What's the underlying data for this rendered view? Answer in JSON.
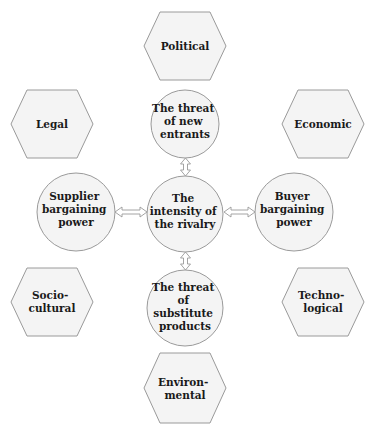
{
  "diagram": {
    "colors": {
      "shape_fill": "#f4f4f4",
      "shape_stroke": "#9a9a9a",
      "text": "#1a1a1a",
      "background": "#ffffff"
    },
    "pestel": [
      {
        "id": "political",
        "lines": [
          "Political"
        ]
      },
      {
        "id": "legal",
        "lines": [
          "Legal"
        ]
      },
      {
        "id": "economic",
        "lines": [
          "Economic"
        ]
      },
      {
        "id": "socio-cultural",
        "lines": [
          "Socio-",
          "cultural"
        ]
      },
      {
        "id": "technological",
        "lines": [
          "Techno-",
          "logical"
        ]
      },
      {
        "id": "environmental",
        "lines": [
          "Environ-",
          "mental"
        ]
      }
    ],
    "forces": [
      {
        "id": "new-entrants",
        "lines": [
          "The threat",
          "of new",
          "entrants"
        ]
      },
      {
        "id": "supplier",
        "lines": [
          "Supplier",
          "bargaining",
          "power"
        ]
      },
      {
        "id": "rivalry",
        "lines": [
          "The",
          "intensity of",
          "the rivalry"
        ]
      },
      {
        "id": "buyer",
        "lines": [
          "Buyer",
          "bargaining",
          "power"
        ]
      },
      {
        "id": "substitutes",
        "lines": [
          "The threat",
          "of",
          "substitute",
          "products"
        ]
      }
    ],
    "connectors": [
      {
        "from": "new-entrants",
        "to": "rivalry",
        "type": "double-arrow"
      },
      {
        "from": "supplier",
        "to": "rivalry",
        "type": "double-arrow"
      },
      {
        "from": "buyer",
        "to": "rivalry",
        "type": "double-arrow"
      },
      {
        "from": "substitutes",
        "to": "rivalry",
        "type": "double-arrow"
      }
    ]
  }
}
